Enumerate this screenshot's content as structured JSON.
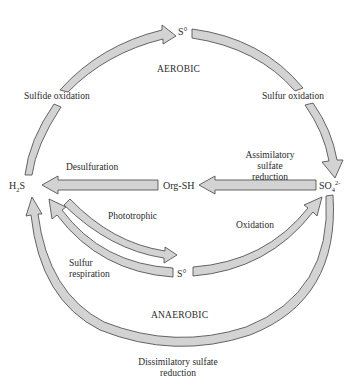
{
  "diagram": {
    "type": "sulfur-cycle",
    "regions": {
      "aerobic": "AEROBIC",
      "anaerobic": "ANAEROBIC"
    },
    "compounds": {
      "s0_top": "S°",
      "s0_middle": "S°",
      "h2s_main": "H",
      "h2s_sub": "2",
      "h2s_tail": "S",
      "so4_main": "SO",
      "so4_sub": "4",
      "so4_sup": "2-",
      "orgsh": "Org-SH"
    },
    "processes": {
      "sulfide_oxidation": "Sulfide oxidation",
      "sulfur_oxidation": "Sulfur oxidation",
      "desulfuration": "Desulfuration",
      "assimilatory_line1": "Assimilatory",
      "assimilatory_line2": "sulfate",
      "assimilatory_line3": "reduction",
      "phototrophic": "Phototrophic",
      "oxidation": "Oxidation",
      "sulfur_respiration_line1": "Sulfur",
      "sulfur_respiration_line2": "respiration",
      "dissimilatory_line1": "Dissimilatory sulfate",
      "dissimilatory_line2": "reduction"
    },
    "colors": {
      "arrow_fill": "#d3d3d3",
      "arrow_stroke": "#555555",
      "text": "#2a2a2a"
    },
    "edges": [
      {
        "from": "H2S",
        "to": "S°",
        "label": "Sulfide oxidation",
        "region": "aerobic"
      },
      {
        "from": "S°",
        "to": "SO4 2-",
        "label": "Sulfur oxidation",
        "region": "aerobic"
      },
      {
        "from": "SO4 2-",
        "to": "Org-SH",
        "label": "Assimilatory sulfate reduction"
      },
      {
        "from": "Org-SH",
        "to": "H2S",
        "label": "Desulfuration"
      },
      {
        "from": "H2S",
        "to": "S°",
        "label": "Phototrophic",
        "region": "anaerobic"
      },
      {
        "from": "S°",
        "to": "H2S",
        "label": "Sulfur respiration",
        "region": "anaerobic"
      },
      {
        "from": "S°",
        "to": "SO4 2-",
        "label": "Oxidation",
        "region": "anaerobic"
      },
      {
        "from": "SO4 2-",
        "to": "H2S",
        "label": "Dissimilatory sulfate reduction",
        "region": "anaerobic"
      }
    ]
  }
}
